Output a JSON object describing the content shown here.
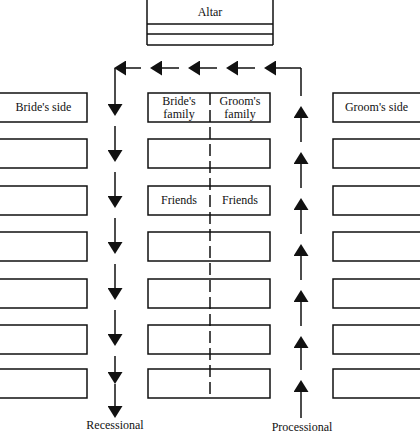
{
  "altar": {
    "label": "Altar"
  },
  "center_pews": {
    "left_header": [
      "Bride's",
      "family"
    ],
    "right_header": [
      "Groom's",
      "family"
    ],
    "friends_left": "Friends",
    "friends_right": "Friends",
    "rows": 7
  },
  "left_side": {
    "label": "Bride's side",
    "rows": 7
  },
  "right_side": {
    "label": "Groom's side",
    "rows": 7
  },
  "paths": {
    "recessional_label": "Recessional",
    "processional_label": "Processional"
  },
  "colors": {
    "ink": "#111111",
    "background": "#ffffff"
  }
}
